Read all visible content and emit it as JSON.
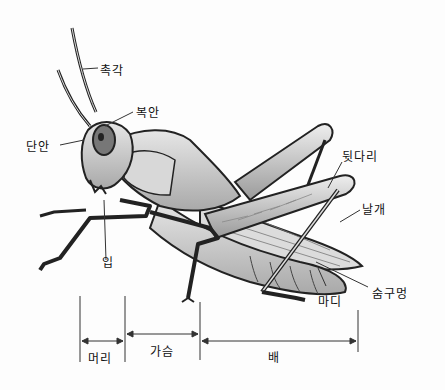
{
  "diagram": {
    "labels": {
      "antenna": "촉각",
      "compound_eye": "복안",
      "simple_eye": "단안",
      "hind_leg": "뒷다리",
      "wing": "날개",
      "mouth": "입",
      "segment": "마디",
      "spiracle": "숨구멍"
    },
    "body_regions": {
      "head": "머리",
      "thorax": "가슴",
      "abdomen": "배"
    }
  }
}
